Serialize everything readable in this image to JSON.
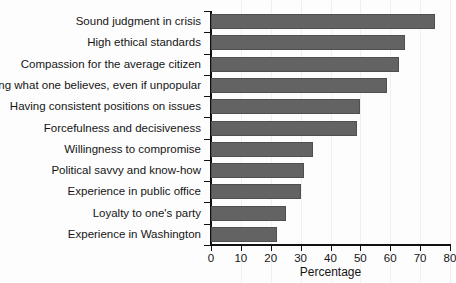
{
  "chart_data": {
    "type": "bar",
    "orientation": "horizontal",
    "title": "",
    "xlabel": "Percentage",
    "ylabel": "",
    "xlim": [
      0,
      80
    ],
    "xticks": [
      0,
      10,
      20,
      30,
      40,
      50,
      60,
      70,
      80
    ],
    "grid": true,
    "legend": null,
    "bar_color": "#636363",
    "categories": [
      "Sound judgment in crisis",
      "High ethical standards",
      "Compassion for the average citizen",
      "Saying what one believes, even if unpopular",
      "Having consistent positions on issues",
      "Forcefulness and decisiveness",
      "Willingness to compromise",
      "Political savvy and know-how",
      "Experience in public office",
      "Loyalty to one's party",
      "Experience in Washington"
    ],
    "values": [
      75,
      65,
      63,
      59,
      50,
      49,
      34,
      31,
      30,
      25,
      22
    ]
  }
}
